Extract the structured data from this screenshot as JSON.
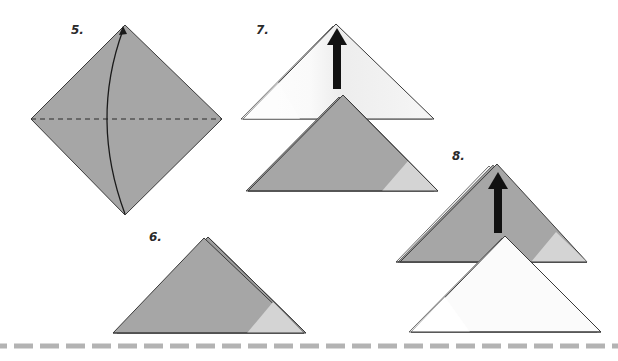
{
  "diagram": {
    "type": "origami-instructions",
    "colors": {
      "paper_colored": "#a6a6a6",
      "paper_light_corner": "#d4d4d4",
      "paper_white": "#fcfcfc",
      "paper_white_shade": "#ececec",
      "outline": "#3a3a3a",
      "arrow": "#111111",
      "separator": "#b3b3b3"
    },
    "steps": [
      {
        "number": "5.",
        "description": "Square diamond with horizontal valley-fold dashed line; curved arrow from bottom corner to top corner"
      },
      {
        "number": "6.",
        "description": "Folded triangle, colored side out"
      },
      {
        "number": "7.",
        "description": "Front triangle layer folded up; black arrow pointing up, white triangle behind colored triangle"
      },
      {
        "number": "8.",
        "description": "Layers stacked; black arrow pointing up, colored triangle behind white triangle"
      }
    ]
  }
}
